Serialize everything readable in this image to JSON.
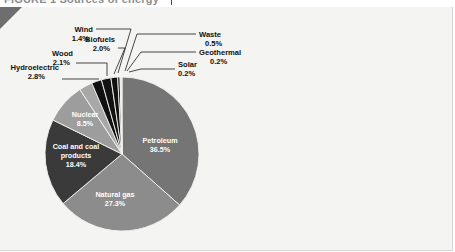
{
  "figure": {
    "clipped_title": "FIGURE 1  Sources of energy",
    "panel_background": "#f4f4f2"
  },
  "chart_data": {
    "type": "pie",
    "title": "",
    "xlabel": "",
    "ylabel": "",
    "units": "percent",
    "legend_position": "none",
    "labels_inside": [
      "Petroleum",
      "Natural gas",
      "Coal and coal products",
      "Nuclear"
    ],
    "categories": [
      "Petroleum",
      "Natural gas",
      "Coal and coal products",
      "Nuclear",
      "Hydroelectric",
      "Wood",
      "Biofuels",
      "Wind",
      "Waste",
      "Geothermal",
      "Solar"
    ],
    "values": [
      36.5,
      27.3,
      18.4,
      8.5,
      2.8,
      2.1,
      2.0,
      1.4,
      0.5,
      0.2,
      0.2
    ],
    "value_labels": [
      "36.5%",
      "27.3%",
      "18.4%",
      "8.5%",
      "2.8%",
      "2.1%",
      "2.0%",
      "1.4%",
      "0.5%",
      "0.2%",
      "0.2%"
    ],
    "colors": [
      "#757575",
      "#8c8c8c",
      "#3a3a3a",
      "#9d9d9d",
      "#a8a8a8",
      "#111111",
      "#111111",
      "#111111",
      "#111111",
      "#d2d2d2",
      "#d2d2d2"
    ],
    "slices": [
      {
        "name": "Petroleum",
        "value": 36.5,
        "label": "Petroleum",
        "value_label": "36.5%",
        "color": "#757575",
        "label_placement": "inside"
      },
      {
        "name": "Natural gas",
        "value": 27.3,
        "label": "Natural gas",
        "value_label": "27.3%",
        "color": "#8c8c8c",
        "label_placement": "inside"
      },
      {
        "name": "Coal and coal products",
        "value": 18.4,
        "label": "Coal and coal products",
        "value_label": "18.4%",
        "color": "#3a3a3a",
        "label_placement": "inside"
      },
      {
        "name": "Nuclear",
        "value": 8.5,
        "label": "Nuclear",
        "value_label": "8.5%",
        "color": "#9d9d9d",
        "label_placement": "inside"
      },
      {
        "name": "Hydroelectric",
        "value": 2.8,
        "label": "Hydroelectric",
        "value_label": "2.8%",
        "color": "#a8a8a8",
        "label_placement": "callout"
      },
      {
        "name": "Wood",
        "value": 2.1,
        "label": "Wood",
        "value_label": "2.1%",
        "color": "#111111",
        "label_placement": "callout"
      },
      {
        "name": "Biofuels",
        "value": 2.0,
        "label": "Biofuels",
        "value_label": "2.0%",
        "color": "#111111",
        "label_placement": "callout"
      },
      {
        "name": "Wind",
        "value": 1.4,
        "label": "Wind",
        "value_label": "1.4%",
        "color": "#111111",
        "label_placement": "callout"
      },
      {
        "name": "Waste",
        "value": 0.5,
        "label": "Waste",
        "value_label": "0.5%",
        "color": "#111111",
        "label_placement": "callout"
      },
      {
        "name": "Geothermal",
        "value": 0.2,
        "label": "Geothermal",
        "value_label": "0.2%",
        "color": "#d2d2d2",
        "label_placement": "callout"
      },
      {
        "name": "Solar",
        "value": 0.2,
        "label": "Solar",
        "value_label": "0.2%",
        "color": "#d2d2d2",
        "label_placement": "callout"
      }
    ]
  }
}
